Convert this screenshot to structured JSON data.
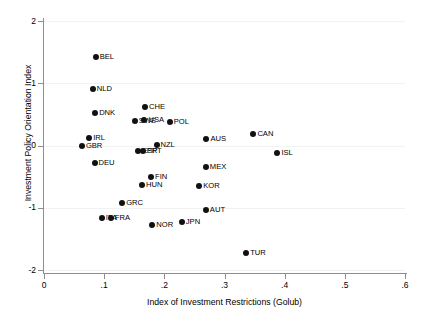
{
  "chart_data": {
    "type": "scatter",
    "title": "",
    "xlabel": "Index of Investment Restrictions (Golub)",
    "ylabel": "Investment Policy Orientation Index",
    "xlim": [
      0,
      0.6
    ],
    "ylim": [
      -2,
      2
    ],
    "xticks": [
      "0",
      ".1",
      ".2",
      ".3",
      ".4",
      ".5",
      ".6"
    ],
    "xtick_values": [
      0,
      0.1,
      0.2,
      0.3,
      0.4,
      0.5,
      0.6
    ],
    "yticks": [
      "2",
      "1",
      "0",
      "-1",
      "-2"
    ],
    "ytick_values": [
      2,
      1,
      0,
      -1,
      -2
    ],
    "grid": "horizontal",
    "legend": "none",
    "marker_color": "#111111",
    "points": [
      {
        "label": "BEL",
        "x": 0.086,
        "y": 1.42
      },
      {
        "label": "NLD",
        "x": 0.081,
        "y": 0.9
      },
      {
        "label": "CHE",
        "x": 0.168,
        "y": 0.62
      },
      {
        "label": "DNK",
        "x": 0.085,
        "y": 0.53
      },
      {
        "label": "SWE",
        "x": 0.151,
        "y": 0.4
      },
      {
        "label": "USA",
        "x": 0.167,
        "y": 0.41
      },
      {
        "label": "POL",
        "x": 0.209,
        "y": 0.37
      },
      {
        "label": "CAN",
        "x": 0.348,
        "y": 0.19
      },
      {
        "label": "IRL",
        "x": 0.075,
        "y": 0.12
      },
      {
        "label": "AUS",
        "x": 0.27,
        "y": 0.1
      },
      {
        "label": "GBR",
        "x": 0.063,
        "y": 0.0
      },
      {
        "label": "NZL",
        "x": 0.187,
        "y": 0.01
      },
      {
        "label": "ESP",
        "x": 0.157,
        "y": -0.09
      },
      {
        "label": "PRT",
        "x": 0.164,
        "y": -0.09
      },
      {
        "label": "ISL",
        "x": 0.388,
        "y": -0.12
      },
      {
        "label": "DEU",
        "x": 0.084,
        "y": -0.28
      },
      {
        "label": "MEX",
        "x": 0.269,
        "y": -0.34
      },
      {
        "label": "FIN",
        "x": 0.178,
        "y": -0.5
      },
      {
        "label": "HUN",
        "x": 0.163,
        "y": -0.63
      },
      {
        "label": "KOR",
        "x": 0.258,
        "y": -0.65
      },
      {
        "label": "GRC",
        "x": 0.13,
        "y": -0.93
      },
      {
        "label": "AUT",
        "x": 0.269,
        "y": -1.03
      },
      {
        "label": "ITA",
        "x": 0.096,
        "y": -1.17
      },
      {
        "label": "FRA",
        "x": 0.111,
        "y": -1.17
      },
      {
        "label": "JPN",
        "x": 0.229,
        "y": -1.23
      },
      {
        "label": "NOR",
        "x": 0.18,
        "y": -1.28
      },
      {
        "label": "TUR",
        "x": 0.336,
        "y": -1.73
      }
    ]
  }
}
